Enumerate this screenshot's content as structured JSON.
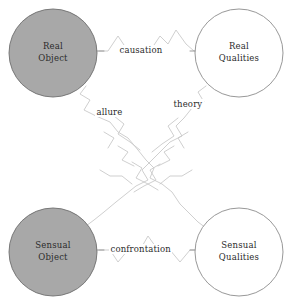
{
  "diagram": {
    "canvas": {
      "width": 292,
      "height": 303,
      "background": "#ffffff"
    },
    "style": {
      "filled_node_fill": "#a8a8a8",
      "filled_node_stroke": "#6e6e6e",
      "open_node_fill": "#ffffff",
      "open_node_stroke": "#8c8c8c",
      "zigzag_stroke": "#c9c9c9",
      "connector_stroke": "#8f8f8f",
      "text_color": "#2b2b2b"
    },
    "nodes": [
      {
        "id": "real-object",
        "line1": "Real",
        "line2": "Object",
        "fill": "filled",
        "cx": 53,
        "cy": 53,
        "r": 44
      },
      {
        "id": "real-qualities",
        "line1": "Real",
        "line2": "Qualities",
        "fill": "open",
        "cx": 239,
        "cy": 53,
        "r": 44
      },
      {
        "id": "sensual-object",
        "line1": "Sensual",
        "line2": "Object",
        "fill": "filled",
        "cx": 53,
        "cy": 252,
        "r": 44
      },
      {
        "id": "sensual-qualities",
        "line1": "Sensual",
        "line2": "Qualities",
        "fill": "open",
        "cx": 239,
        "cy": 252,
        "r": 44
      }
    ],
    "edges": [
      {
        "id": "causation",
        "label": "causation",
        "from": "real-object",
        "to": "real-qualities",
        "label_x": 118,
        "label_y": 45
      },
      {
        "id": "allure",
        "label": "allure",
        "from": "real-object",
        "to": "sensual-qualities",
        "label_x": 95,
        "label_y": 107
      },
      {
        "id": "theory",
        "label": "theory",
        "from": "real-qualities",
        "to": "sensual-object",
        "label_x": 172,
        "label_y": 99
      },
      {
        "id": "confrontation",
        "label": "confrontation",
        "from": "sensual-object",
        "to": "sensual-qualities",
        "label_x": 109,
        "label_y": 244
      }
    ]
  }
}
